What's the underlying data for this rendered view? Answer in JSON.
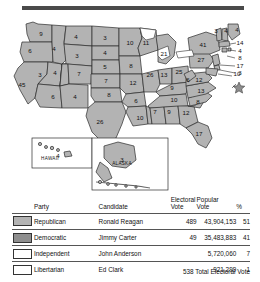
{
  "map": {
    "title": "1980 Presidential Election Electoral Map",
    "colors": {
      "republican": "#b3b3b3",
      "democratic": "#8e8e8e",
      "other": "#ffffff",
      "border": "#2b2b2b"
    },
    "insets": {
      "hawaii_label": "HAWAII",
      "alaska_label": "ALASKA"
    },
    "dc_marker": "star",
    "states": [
      {
        "code": "WA",
        "votes": "9",
        "x": 41,
        "y": 22
      },
      {
        "code": "OR",
        "votes": "6",
        "x": 30,
        "y": 39
      },
      {
        "code": "CA",
        "votes": "45",
        "x": 22,
        "y": 73
      },
      {
        "code": "NV",
        "votes": "3",
        "x": 40,
        "y": 63
      },
      {
        "code": "ID",
        "votes": "4",
        "x": 54,
        "y": 37
      },
      {
        "code": "MT",
        "votes": "4",
        "x": 76,
        "y": 25
      },
      {
        "code": "WY",
        "votes": "3",
        "x": 77,
        "y": 44
      },
      {
        "code": "UT",
        "votes": "4",
        "x": 55,
        "y": 61
      },
      {
        "code": "AZ",
        "votes": "6",
        "x": 53,
        "y": 85
      },
      {
        "code": "CO",
        "votes": "7",
        "x": 79,
        "y": 62
      },
      {
        "code": "NM",
        "votes": "4",
        "x": 75,
        "y": 85
      },
      {
        "code": "ND",
        "votes": "3",
        "x": 105,
        "y": 26
      },
      {
        "code": "SD",
        "votes": "4",
        "x": 105,
        "y": 41
      },
      {
        "code": "NE",
        "votes": "5",
        "x": 105,
        "y": 55
      },
      {
        "code": "KS",
        "votes": "7",
        "x": 106,
        "y": 69
      },
      {
        "code": "OK",
        "votes": "8",
        "x": 109,
        "y": 83
      },
      {
        "code": "TX",
        "votes": "26",
        "x": 100,
        "y": 110
      },
      {
        "code": "MN",
        "votes": "10",
        "x": 130,
        "y": 31
      },
      {
        "code": "IA",
        "votes": "8",
        "x": 131,
        "y": 54
      },
      {
        "code": "MO",
        "votes": "12",
        "x": 133,
        "y": 71
      },
      {
        "code": "AR",
        "votes": "6",
        "x": 136,
        "y": 89
      },
      {
        "code": "LA",
        "votes": "10",
        "x": 140,
        "y": 106
      },
      {
        "code": "WI",
        "votes": "11",
        "x": 146,
        "y": 31
      },
      {
        "code": "IL",
        "votes": "26",
        "x": 150,
        "y": 63
      },
      {
        "code": "IN",
        "votes": "13",
        "x": 164,
        "y": 63
      },
      {
        "code": "MI",
        "votes": "21",
        "x": 164,
        "y": 42
      },
      {
        "code": "OH",
        "votes": "25",
        "x": 179,
        "y": 60
      },
      {
        "code": "KY",
        "votes": "9",
        "x": 172,
        "y": 76
      },
      {
        "code": "TN",
        "votes": "10",
        "x": 174,
        "y": 88
      },
      {
        "code": "MS",
        "votes": "7",
        "x": 155,
        "y": 100
      },
      {
        "code": "AL",
        "votes": "9",
        "x": 169,
        "y": 100
      },
      {
        "code": "GA",
        "votes": "12",
        "x": 186,
        "y": 101
      },
      {
        "code": "FL",
        "votes": "17",
        "x": 199,
        "y": 122
      },
      {
        "code": "SC",
        "votes": "8",
        "x": 198,
        "y": 90
      },
      {
        "code": "NC",
        "votes": "13",
        "x": 201,
        "y": 79
      },
      {
        "code": "VA",
        "votes": "12",
        "x": 199,
        "y": 68
      },
      {
        "code": "WV",
        "votes": "6",
        "x": 188,
        "y": 68
      },
      {
        "code": "PA",
        "votes": "27",
        "x": 201,
        "y": 48
      },
      {
        "code": "NY",
        "votes": "41",
        "x": 203,
        "y": 33
      },
      {
        "code": "VT",
        "votes": "3",
        "x": 216,
        "y": 19
      },
      {
        "code": "NH",
        "votes": "4",
        "x": 226,
        "y": 19
      },
      {
        "code": "ME",
        "votes": "4",
        "x": 237,
        "y": 18
      },
      {
        "code": "MA",
        "votes": "14",
        "x": 240,
        "y": 31
      },
      {
        "code": "RI",
        "votes": "4",
        "x": 240,
        "y": 39
      },
      {
        "code": "CT",
        "votes": "8",
        "x": 240,
        "y": 46
      },
      {
        "code": "NJ",
        "votes": "17",
        "x": 240,
        "y": 54
      },
      {
        "code": "DE",
        "votes": "3",
        "x": 240,
        "y": 61
      },
      {
        "code": "MD",
        "votes": "10",
        "x": 237,
        "y": 62
      },
      {
        "code": "AK",
        "votes": "3",
        "x": 122,
        "y": 148
      },
      {
        "code": "HI",
        "votes": "4",
        "x": 58,
        "y": 144
      }
    ]
  },
  "table": {
    "headers": {
      "party": "Party",
      "candidate": "Candidate",
      "electoral_vote_l1": "Electoral",
      "electoral_vote_l2": "Vote",
      "popular_vote_l1": "Popular",
      "popular_vote_l2": "Vote",
      "percent": "%"
    },
    "rows": [
      {
        "party": "Republican",
        "candidate": "Ronald Reagan",
        "electoral": "489",
        "popular": "43,904,153",
        "percent": "51",
        "swatch": "#b3b3b3"
      },
      {
        "party": "Democratic",
        "candidate": "Jimmy Carter",
        "electoral": "49",
        "popular": "35,483,883",
        "percent": "41",
        "swatch": "#8e8e8e"
      },
      {
        "party": "Independent",
        "candidate": "John Anderson",
        "electoral": "",
        "popular": "5,720,060",
        "percent": "7",
        "swatch": "#ffffff"
      },
      {
        "party": "Libertarian",
        "candidate": "Ed Clark",
        "electoral": "",
        "popular": "921,299",
        "percent": "1",
        "swatch": "#ffffff"
      }
    ],
    "total_note": "538 Total Electoral Vote"
  }
}
